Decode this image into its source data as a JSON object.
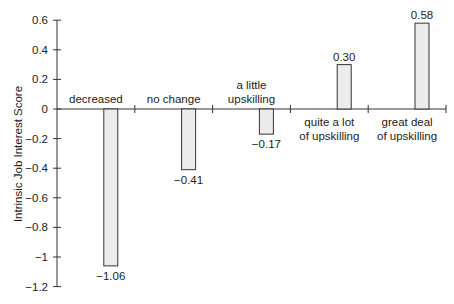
{
  "chart_data": {
    "type": "bar",
    "title": "",
    "xlabel": "",
    "ylabel": "Intrinsic Job Interest Score",
    "ylim": [
      -1.2,
      0.6
    ],
    "yticks": [
      0.6,
      0.4,
      0.2,
      0,
      -0.2,
      -0.4,
      -0.6,
      -0.8,
      -1,
      -1.2
    ],
    "ytick_labels": [
      "0.6",
      "0.4",
      "0.2",
      "0",
      "−0.2",
      "−0.4",
      "−0.6",
      "−0.8",
      "−1",
      "−1.2"
    ],
    "categories": [
      [
        "decreased"
      ],
      [
        "no change"
      ],
      [
        "a little",
        "upskilling"
      ],
      [
        "quite a lot",
        "of upskilling"
      ],
      [
        "great deal",
        "of upskilling"
      ]
    ],
    "values": [
      -1.06,
      -0.41,
      -0.17,
      0.3,
      0.58
    ],
    "value_labels": [
      "−1.06",
      "−0.41",
      "−0.17",
      "0.30",
      "0.58"
    ],
    "grid": false,
    "legend": null,
    "colors": {
      "bar_fill": "#ececec",
      "bar_stroke": "#333333",
      "axis": "#333333",
      "text": "#222222"
    }
  }
}
